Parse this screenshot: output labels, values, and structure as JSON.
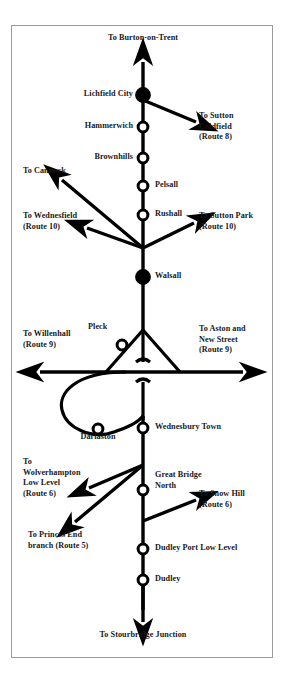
{
  "diagram": {
    "type": "transit-route-diagram",
    "colors": {
      "line": "#000000",
      "frame": "#9a9a9a",
      "background": "#ffffff",
      "text": "#19191c",
      "station_fill_major": "#000000",
      "station_fill_minor": "#ffffff"
    },
    "terminals": {
      "north": "To Burton-on-Trent",
      "south": "To Stourbridge Junction"
    },
    "stations": [
      {
        "name": "Lichfield City",
        "type": "major",
        "side": "left"
      },
      {
        "name": "Hammerwich",
        "type": "minor",
        "side": "left"
      },
      {
        "name": "Brownhills",
        "type": "minor",
        "side": "left"
      },
      {
        "name": "Pelsall",
        "type": "minor",
        "side": "right"
      },
      {
        "name": "Rushall",
        "type": "minor",
        "side": "right"
      },
      {
        "name": "Walsall",
        "type": "major",
        "side": "right"
      },
      {
        "name": "Pleck",
        "type": "minor",
        "side": "left"
      },
      {
        "name": "Darlaston",
        "type": "minor",
        "side": "below"
      },
      {
        "name": "Wednesbury Town",
        "type": "minor",
        "side": "right"
      },
      {
        "name": "Great Bridge North",
        "type": "minor",
        "side": "right"
      },
      {
        "name": "Dudley Port Low Level",
        "type": "minor",
        "side": "right"
      },
      {
        "name": "Dudley",
        "type": "minor",
        "side": "right"
      }
    ],
    "branches": [
      {
        "label": "To Sutton\nColdfield\n(Route 8)",
        "direction": "east"
      },
      {
        "label": "To Cannock",
        "direction": "northwest"
      },
      {
        "label": "To Wednesfield\n(Route 10)",
        "direction": "west"
      },
      {
        "label": "To Sutton Park\n(Route 10)",
        "direction": "east"
      },
      {
        "label": "To Willenhall\n(Route 9)",
        "direction": "west"
      },
      {
        "label": "To Aston and\nNew Street\n(Route 9)",
        "direction": "east"
      },
      {
        "label": "To\nWolverhampton\nLow Level\n(Route 6)",
        "direction": "west"
      },
      {
        "label": "To Princes End\nbranch (Route 5)",
        "direction": "southwest"
      },
      {
        "label": "To Snow Hill\n(Route 6)",
        "direction": "east"
      }
    ],
    "labels": {
      "burton_on_trent": "To Burton-on-Trent",
      "lichfield_city": "Lichfield City",
      "hammerwich": "Hammerwich",
      "sutton_coldfield": "To Sutton\nColdfield\n(Route 8)",
      "brownhills": "Brownhills",
      "cannock": "To Cannock",
      "pelsall": "Pelsall",
      "wednesfield": "To Wednesfield\n(Route 10)",
      "rushall": "Rushall",
      "sutton_park": "To Sutton Park\n(Route 10)",
      "walsall": "Walsall",
      "pleck": "Pleck",
      "willenhall": "To Willenhall\n(Route 9)",
      "aston_new_street": "To Aston and\nNew Street\n(Route 9)",
      "darlaston": "Darlaston",
      "wednesbury_town": "Wednesbury Town",
      "wolverhampton_low_level": "To\nWolverhampton\nLow Level\n(Route 6)",
      "great_bridge_north": "Great Bridge\nNorth",
      "snow_hill": "To Snow Hill\n(Route 6)",
      "princes_end": "To Princes End\nbranch (Route 5)",
      "dudley_port_low_level": "Dudley Port Low Level",
      "dudley": "Dudley",
      "stourbridge_junction": "To Stourbridge Junction"
    }
  }
}
